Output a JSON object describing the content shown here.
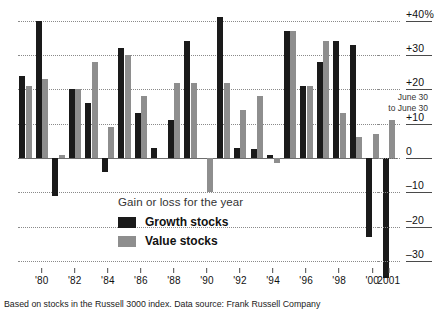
{
  "chart_data": {
    "type": "bar",
    "title": "",
    "subtitle": "",
    "xlabel": "",
    "ylabel": "",
    "ylim": [
      -35,
      42
    ],
    "grid": true,
    "legend_position": "inside-center",
    "y_ticks": [
      {
        "value": 40,
        "label": "+40%"
      },
      {
        "value": 30,
        "label": "+30"
      },
      {
        "value": 20,
        "label": "+20"
      },
      {
        "value": 10,
        "label": "+10"
      },
      {
        "value": 0,
        "label": "0"
      },
      {
        "value": -10,
        "label": "–10"
      },
      {
        "value": -20,
        "label": "–20"
      },
      {
        "value": -30,
        "label": "–30"
      }
    ],
    "x_ticks": [
      {
        "index": 1,
        "label": "'80"
      },
      {
        "index": 3,
        "label": "'82"
      },
      {
        "index": 5,
        "label": "'84"
      },
      {
        "index": 7,
        "label": "'86"
      },
      {
        "index": 9,
        "label": "'88"
      },
      {
        "index": 11,
        "label": "'90"
      },
      {
        "index": 13,
        "label": "'92"
      },
      {
        "index": 15,
        "label": "'94"
      },
      {
        "index": 17,
        "label": "'96"
      },
      {
        "index": 19,
        "label": "'98"
      },
      {
        "index": 21,
        "label": "'00"
      },
      {
        "index": 22,
        "label": "2001"
      }
    ],
    "categories": [
      "1979",
      "1980",
      "1981",
      "1982",
      "1983",
      "1984",
      "1985",
      "1986",
      "1987",
      "1988",
      "1989",
      "1990",
      "1991",
      "1992",
      "1993",
      "1994",
      "1995",
      "1996",
      "1997",
      "1998",
      "1999",
      "2000",
      "2001"
    ],
    "series": [
      {
        "name": "Growth stocks",
        "color": "#1a1a1a",
        "values": [
          24,
          40,
          -11,
          20,
          16,
          -4,
          32,
          13,
          3,
          11,
          34,
          0,
          41,
          3,
          2.5,
          1,
          37,
          21,
          28,
          34,
          33,
          -23,
          -35
        ]
      },
      {
        "name": "Value stocks",
        "color": "#8e8e8e",
        "values": [
          21,
          23,
          1,
          20,
          28,
          9,
          30,
          18,
          0,
          22,
          22,
          -10,
          22,
          14,
          18,
          -1.5,
          37,
          21,
          34,
          13,
          6,
          7,
          11
        ]
      }
    ],
    "annotations": [
      {
        "name": "june-to-june",
        "text_line1": "June 30",
        "text_line2": "to June 30"
      }
    ]
  },
  "legend": {
    "title": "Gain or loss for the year",
    "items": [
      {
        "label": "Growth stocks",
        "color": "#1a1a1a"
      },
      {
        "label": "Value stocks",
        "color": "#8e8e8e"
      }
    ]
  },
  "caption": {
    "text": "Based on stocks in the Russell 3000 index.  Data source: Frank Russell Company"
  }
}
